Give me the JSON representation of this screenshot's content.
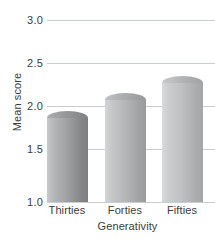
{
  "chart_data": {
    "type": "bar",
    "title": "",
    "categories": [
      "Thirties",
      "Forties",
      "Fifties"
    ],
    "values": [
      2.0,
      2.2,
      2.38
    ],
    "series": [
      {
        "name": "Mean score",
        "values": [
          2.0,
          2.2,
          2.38
        ]
      }
    ],
    "xlabel": "Generativity",
    "ylabel": "Mean score",
    "ylim": [
      1.0,
      3.0
    ],
    "yticks": [
      1.0,
      1.5,
      2.0,
      2.5,
      3.0
    ],
    "ytick_labels": [
      "1.0",
      "1.5",
      "2.0",
      "2.5",
      "3.0"
    ],
    "grid": true,
    "legend": false,
    "legend_position": "none",
    "bar_color": "#b3b4b5",
    "gridline_color": "#c9cdd2",
    "text_color": "#3c3c3c"
  },
  "axes": {
    "y_title": "Mean score",
    "x_title": "Generativity",
    "y_ticks": [
      {
        "label": "3.0",
        "value": 3.0
      },
      {
        "label": "2.5",
        "value": 2.5
      },
      {
        "label": "2.0",
        "value": 2.0
      },
      {
        "label": "1.5",
        "value": 1.5
      },
      {
        "label": "1.0",
        "value": 1.0
      }
    ],
    "x_categories": [
      {
        "label": "Thirties"
      },
      {
        "label": "Forties"
      },
      {
        "label": "Fifties"
      }
    ]
  }
}
